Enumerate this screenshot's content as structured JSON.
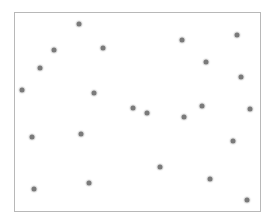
{
  "chart_data": {
    "type": "scatter",
    "title": "",
    "xlabel": "",
    "ylabel": "",
    "grid": false,
    "legend": null,
    "marker_color": "#7a7a7a",
    "frame_color": "#b8b8b8",
    "points_px": [
      [
        79,
        24
      ],
      [
        54,
        50
      ],
      [
        103,
        48
      ],
      [
        40,
        68
      ],
      [
        22,
        90
      ],
      [
        94,
        93
      ],
      [
        182,
        40
      ],
      [
        237,
        35
      ],
      [
        206,
        62
      ],
      [
        241,
        77
      ],
      [
        133,
        108
      ],
      [
        147,
        113
      ],
      [
        184,
        117
      ],
      [
        202,
        106
      ],
      [
        250,
        109
      ],
      [
        32,
        137
      ],
      [
        81,
        134
      ],
      [
        233,
        141
      ],
      [
        160,
        167
      ],
      [
        210,
        179
      ],
      [
        34,
        189
      ],
      [
        89,
        183
      ],
      [
        247,
        200
      ]
    ]
  }
}
